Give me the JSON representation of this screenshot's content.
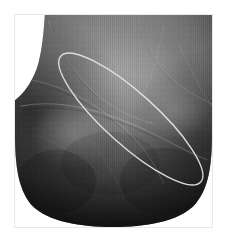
{
  "viewer": {
    "width": 228,
    "height": 245,
    "background_color": "#ffffff"
  },
  "frame": {
    "x": 14,
    "y": 14,
    "width": 199,
    "height": 214,
    "border_color": "#e8e8e8",
    "border_width": 1
  },
  "scan": {
    "modality": "palmprint",
    "colorspace": "grayscale",
    "background_color": "#ffffff",
    "silhouette_fill": "#6f6f6f",
    "tone_light": "#9a9a9a",
    "tone_mid": "#7c7c7c",
    "tone_dark": "#3a3a3a",
    "tone_deepest": "#1c1c1c",
    "scanline_overlay": true,
    "scanline_color": "#000000",
    "scanline_opacity": 0.1,
    "notch_top_left": {
      "shape": "concave-curve",
      "fill": "#ffffff"
    },
    "notch_top_right": {
      "shape": "circle",
      "cx": 193,
      "cy": 9,
      "r": 13,
      "fill": "#ffffff"
    },
    "crease_color": "#d7d7d7",
    "crease_opacity": 0.35
  },
  "roi": {
    "label": "region-of-interest",
    "shape": "ellipse",
    "center_x": 117,
    "center_y": 105,
    "radius_major": 95,
    "radius_minor": 26,
    "rotation_deg": 42,
    "stroke_color": "#e6e6e6",
    "stroke_width": 1.4,
    "fill": "none"
  }
}
